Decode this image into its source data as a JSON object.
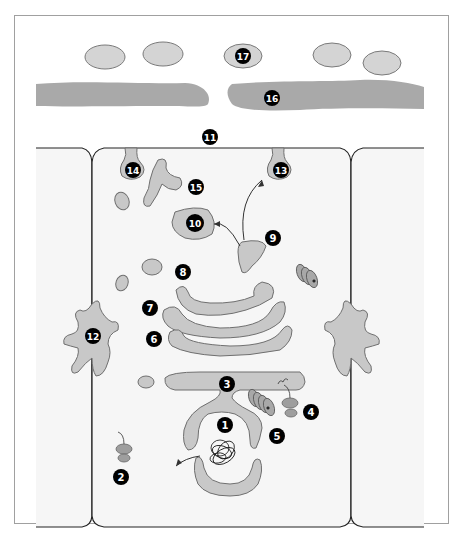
{
  "diagram": {
    "type": "cell-schematic",
    "colors": {
      "background": "#ffffff",
      "frame_border": "#9a9a9a",
      "cell_fill": "#f7f7f7",
      "organelle_fill": "#c9c9c9",
      "organelle_stroke": "#6f6f6f",
      "dark_organelle": "#a7a7a7",
      "label_bg": "#000000",
      "label_text": "#ffffff",
      "line": "#333333"
    },
    "labels": [
      {
        "id": "1",
        "text": "1"
      },
      {
        "id": "2",
        "text": "2"
      },
      {
        "id": "3",
        "text": "3"
      },
      {
        "id": "4",
        "text": "4"
      },
      {
        "id": "5",
        "text": "5"
      },
      {
        "id": "6",
        "text": "6"
      },
      {
        "id": "7",
        "text": "7"
      },
      {
        "id": "8",
        "text": "8"
      },
      {
        "id": "9",
        "text": "9"
      },
      {
        "id": "10",
        "text": "10"
      },
      {
        "id": "11",
        "text": "11"
      },
      {
        "id": "12",
        "text": "12"
      },
      {
        "id": "13",
        "text": "13"
      },
      {
        "id": "14",
        "text": "14"
      },
      {
        "id": "15",
        "text": "15"
      },
      {
        "id": "16",
        "text": "16"
      },
      {
        "id": "17",
        "text": "17"
      }
    ]
  }
}
